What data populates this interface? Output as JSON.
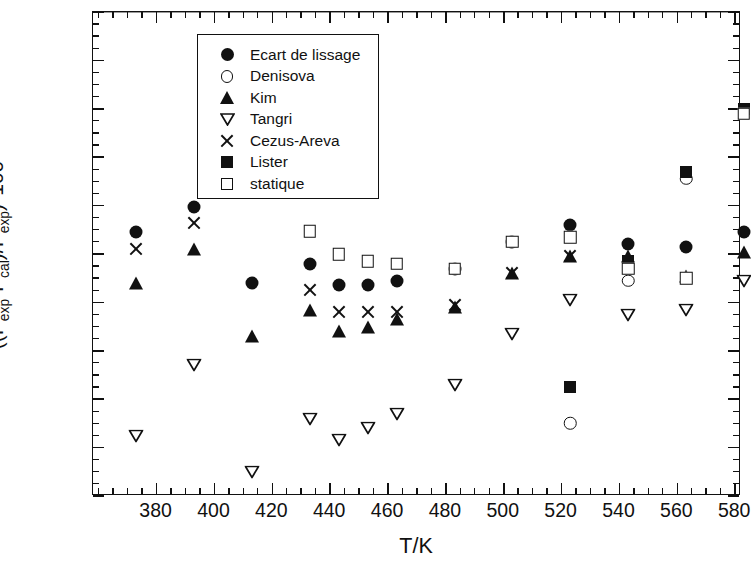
{
  "chart_data": {
    "type": "scatter",
    "title": "",
    "xlabel": "T/K",
    "ylabel": "((Pexp-Pcal)/Pexp)*100",
    "ylabel_html": "((P<sub>exp</sub>-P<sub>cal</sub>)/P<sub>exp</sub>)*100",
    "xlim": [
      358,
      582
    ],
    "ylim": [
      -100,
      100
    ],
    "xticks": [
      380,
      400,
      420,
      440,
      460,
      480,
      500,
      520,
      540,
      560,
      580
    ],
    "yticks": [
      -100,
      -80,
      -60,
      -40,
      -20,
      0,
      20,
      40,
      60,
      80,
      100
    ],
    "xtick_labels": [
      "380",
      "400",
      "420",
      "440",
      "460",
      "480",
      "500",
      "520",
      "540",
      "560",
      "580"
    ],
    "ytick_labels": [
      "-100",
      "-80",
      "-60",
      "-40",
      "-20",
      "0",
      "20",
      "40",
      "60",
      "80",
      "100"
    ],
    "x_minor_interval": 5,
    "y_minor_interval": 5,
    "grid": false,
    "zero_line": true,
    "legend_position": "upper-left",
    "series": [
      {
        "name": "Ecart de lissage",
        "marker": "circle-filled",
        "points": [
          {
            "x": 373,
            "y": 9
          },
          {
            "x": 393,
            "y": 19.5
          },
          {
            "x": 413,
            "y": -12
          },
          {
            "x": 433,
            "y": -4
          },
          {
            "x": 443,
            "y": -13
          },
          {
            "x": 453,
            "y": -13
          },
          {
            "x": 463,
            "y": -11
          },
          {
            "x": 483,
            "y": -6
          },
          {
            "x": 503,
            "y": 5
          },
          {
            "x": 523,
            "y": 12
          },
          {
            "x": 543,
            "y": 4
          },
          {
            "x": 563,
            "y": 3
          },
          {
            "x": 583,
            "y": 9
          }
        ]
      },
      {
        "name": "Denisova",
        "marker": "circle-open",
        "points": [
          {
            "x": 523,
            "y": -70
          },
          {
            "x": 543,
            "y": -11
          },
          {
            "x": 563,
            "y": 31
          }
        ]
      },
      {
        "name": "Kim",
        "marker": "triangle-up-filled",
        "points": [
          {
            "x": 373,
            "y": -12
          },
          {
            "x": 393,
            "y": 2
          },
          {
            "x": 413,
            "y": -34
          },
          {
            "x": 433,
            "y": -23
          },
          {
            "x": 443,
            "y": -32
          },
          {
            "x": 453,
            "y": -30
          },
          {
            "x": 463,
            "y": -27
          },
          {
            "x": 483,
            "y": -22
          },
          {
            "x": 503,
            "y": -8
          },
          {
            "x": 523,
            "y": -1
          },
          {
            "x": 543,
            "y": -1
          },
          {
            "x": 563,
            "y": -9
          },
          {
            "x": 583,
            "y": 1
          }
        ]
      },
      {
        "name": "Tangri",
        "marker": "triangle-down-open",
        "points": [
          {
            "x": 373,
            "y": -75
          },
          {
            "x": 393,
            "y": -46
          },
          {
            "x": 413,
            "y": -90
          },
          {
            "x": 433,
            "y": -68
          },
          {
            "x": 443,
            "y": -77
          },
          {
            "x": 453,
            "y": -72
          },
          {
            "x": 463,
            "y": -66
          },
          {
            "x": 483,
            "y": -54
          },
          {
            "x": 503,
            "y": -33
          },
          {
            "x": 523,
            "y": -19
          },
          {
            "x": 543,
            "y": -25
          },
          {
            "x": 563,
            "y": -23
          },
          {
            "x": 583,
            "y": -11
          }
        ]
      },
      {
        "name": "Cezus-Areva",
        "marker": "x-cross",
        "points": [
          {
            "x": 373,
            "y": 2
          },
          {
            "x": 393,
            "y": 13
          },
          {
            "x": 433,
            "y": -15
          },
          {
            "x": 443,
            "y": -24
          },
          {
            "x": 453,
            "y": -24
          },
          {
            "x": 463,
            "y": -24
          },
          {
            "x": 483,
            "y": -21
          },
          {
            "x": 503,
            "y": -8
          },
          {
            "x": 523,
            "y": -1
          }
        ]
      },
      {
        "name": "Lister",
        "marker": "square-filled",
        "points": [
          {
            "x": 523,
            "y": -55
          },
          {
            "x": 543,
            "y": -3
          },
          {
            "x": 563,
            "y": 34
          },
          {
            "x": 583,
            "y": 60
          }
        ]
      },
      {
        "name": "statique",
        "marker": "square-open",
        "points": [
          {
            "x": 433,
            "y": 9.5
          },
          {
            "x": 443,
            "y": 0
          },
          {
            "x": 453,
            "y": -3
          },
          {
            "x": 463,
            "y": -4
          },
          {
            "x": 483,
            "y": -6
          },
          {
            "x": 503,
            "y": 5
          },
          {
            "x": 523,
            "y": 7
          },
          {
            "x": 543,
            "y": -6
          },
          {
            "x": 563,
            "y": -10
          },
          {
            "x": 583,
            "y": 58
          }
        ]
      }
    ]
  },
  "legend": {
    "items": [
      {
        "label": "Ecart de lissage",
        "marker": "circle-filled"
      },
      {
        "label": "Denisova",
        "marker": "circle-open"
      },
      {
        "label": "Kim",
        "marker": "triangle-up-filled"
      },
      {
        "label": "Tangri",
        "marker": "triangle-down-open"
      },
      {
        "label": "Cezus-Areva",
        "marker": "x-cross"
      },
      {
        "label": "Lister",
        "marker": "square-filled"
      },
      {
        "label": "statique",
        "marker": "square-open"
      }
    ]
  },
  "axes": {
    "x_title": "T/K",
    "y_title_parts": [
      "((P",
      "exp",
      "-P",
      "cal",
      ")/P",
      "exp",
      ")*100"
    ]
  }
}
